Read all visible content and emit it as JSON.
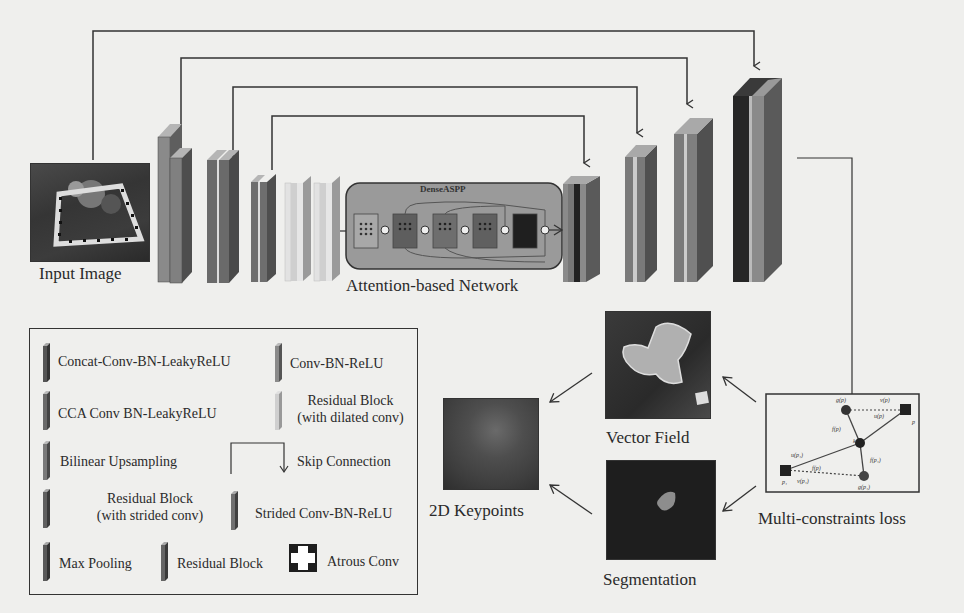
{
  "labels": {
    "input_image": "Input Image",
    "attention_network": "Attention-based Network",
    "dense_aspp": "DenseASPP",
    "vector_field": "Vector Field",
    "keypoints": "2D Keypoints",
    "segmentation": "Segmentation",
    "loss": "Multi-constraints loss"
  },
  "legend": {
    "items": [
      {
        "label": "Concat-Conv-BN-LeakyReLU",
        "color": "#555555"
      },
      {
        "label": "Conv-BN-ReLU",
        "color": "#8a8a8a"
      },
      {
        "label": "CCA Conv BN-LeakyReLU",
        "color": "#6a6a6a"
      },
      {
        "label": "Residual Block",
        "label2": "(with dilated conv)",
        "color": "#c8c8c8"
      },
      {
        "label": "Bilinear Upsampling",
        "color": "#7a7a7a"
      },
      {
        "label": "Skip Connection"
      },
      {
        "label": "Residual Block",
        "label2": "(with strided conv)",
        "color": "#606060"
      },
      {
        "label": "Strided Conv-BN-ReLU",
        "color": "#707070"
      },
      {
        "label": "Max Pooling",
        "color": "#5a5a5a"
      },
      {
        "label": "Residual Block",
        "color": "#656565"
      },
      {
        "label": "Atrous Conv"
      }
    ]
  },
  "loss_diagram": {
    "points": [
      "u(p₁)",
      "v(p₁)",
      "v(p)",
      "u(p)",
      "f(p)",
      "f(p₁)",
      "g(p)",
      "g(p₁)",
      "k",
      "p",
      "p₁"
    ]
  },
  "colors": {
    "background": "#efefed",
    "block_dark": "#2e2e2e",
    "block_mid": "#7d7d7d",
    "block_light": "#cfcfcf",
    "aspp_box": "#9a9a9a"
  }
}
